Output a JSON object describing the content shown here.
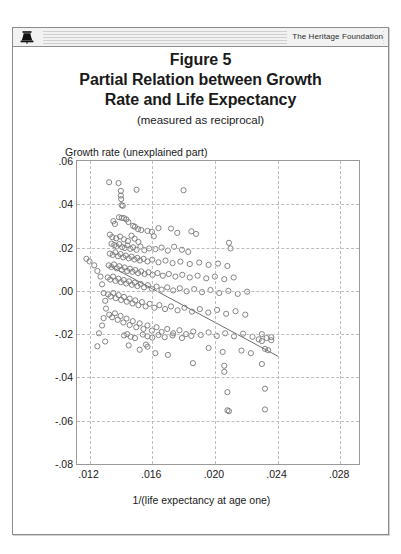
{
  "header": {
    "brand": "The Heritage Foundation",
    "logo_icon": "liberty-bell-icon"
  },
  "title": {
    "line1": "Figure 5",
    "line2": "Partial Relation between Growth",
    "line3": "Rate and Life Expectancy",
    "subtitle": "(measured as reciprocal)"
  },
  "chart_data": {
    "type": "scatter",
    "xlabel": "1/(life expectancy at age one)",
    "ylabel": "Growth rate (unexplained part)",
    "xlim": [
      0.0112,
      0.0292
    ],
    "ylim": [
      -0.08,
      0.06
    ],
    "xticks": [
      0.012,
      0.016,
      0.02,
      0.024,
      0.028
    ],
    "xtick_labels": [
      ".012",
      ".016",
      ".020",
      ".024",
      ".028"
    ],
    "yticks": [
      0.06,
      0.04,
      0.02,
      0.0,
      -0.02,
      -0.04,
      -0.06,
      -0.08
    ],
    "ytick_labels": [
      ".06",
      ".04",
      ".02",
      ".00",
      "-.02",
      "-.04",
      "-.06",
      "-.08"
    ],
    "grid": true,
    "grid_style": "dashed",
    "grid_color": "#bdbdbd",
    "legend": null,
    "marker": {
      "shape": "open-circle",
      "radius_px": 2.6,
      "stroke": "#777777",
      "fill": "none",
      "stroke_width": 0.9
    },
    "fit_line": {
      "label": "partial regression line",
      "color": "#6e6e6e",
      "width": 1,
      "x_start": 0.0133,
      "y_start": 0.0115,
      "x_end": 0.0241,
      "y_end": -0.0305
    },
    "points": [
      [
        0.01325,
        0.0502
      ],
      [
        0.01385,
        0.0498
      ],
      [
        0.014,
        0.0462
      ],
      [
        0.014,
        0.044
      ],
      [
        0.01402,
        0.0424
      ],
      [
        0.01405,
        0.0396
      ],
      [
        0.01412,
        0.0393
      ],
      [
        0.015,
        0.0467
      ],
      [
        0.018,
        0.0465
      ],
      [
        0.01388,
        0.034
      ],
      [
        0.01405,
        0.0337
      ],
      [
        0.0142,
        0.0336
      ],
      [
        0.01435,
        0.033
      ],
      [
        0.01352,
        0.0322
      ],
      [
        0.01362,
        0.0309
      ],
      [
        0.01448,
        0.0318
      ],
      [
        0.01478,
        0.03
      ],
      [
        0.0149,
        0.0296
      ],
      [
        0.0151,
        0.0285
      ],
      [
        0.0153,
        0.0281
      ],
      [
        0.0157,
        0.0277
      ],
      [
        0.01598,
        0.0273
      ],
      [
        0.0164,
        0.029
      ],
      [
        0.0172,
        0.0288
      ],
      [
        0.0176,
        0.0268
      ],
      [
        0.0185,
        0.0275
      ],
      [
        0.0188,
        0.0263
      ],
      [
        0.0161,
        0.0252
      ],
      [
        0.0133,
        0.026
      ],
      [
        0.01345,
        0.0248
      ],
      [
        0.0137,
        0.0243
      ],
      [
        0.01395,
        0.0251
      ],
      [
        0.0142,
        0.0238
      ],
      [
        0.01445,
        0.023
      ],
      [
        0.01468,
        0.0255
      ],
      [
        0.01488,
        0.0241
      ],
      [
        0.01512,
        0.0226
      ],
      [
        0.0134,
        0.0218
      ],
      [
        0.01358,
        0.0212
      ],
      [
        0.01372,
        0.0206
      ],
      [
        0.0139,
        0.0216
      ],
      [
        0.01408,
        0.0202
      ],
      [
        0.01425,
        0.0198
      ],
      [
        0.01442,
        0.021
      ],
      [
        0.0146,
        0.0194
      ],
      [
        0.01478,
        0.0201
      ],
      [
        0.015,
        0.019
      ],
      [
        0.01525,
        0.0205
      ],
      [
        0.0155,
        0.0188
      ],
      [
        0.0158,
        0.0196
      ],
      [
        0.0162,
        0.0193
      ],
      [
        0.0166,
        0.02
      ],
      [
        0.017,
        0.0186
      ],
      [
        0.0174,
        0.0204
      ],
      [
        0.0179,
        0.019
      ],
      [
        0.0183,
        0.018
      ],
      [
        0.0209,
        0.0222
      ],
      [
        0.021,
        0.0196
      ],
      [
        0.0133,
        0.0172
      ],
      [
        0.01348,
        0.0166
      ],
      [
        0.01365,
        0.0178
      ],
      [
        0.01382,
        0.016
      ],
      [
        0.01398,
        0.017
      ],
      [
        0.01415,
        0.0155
      ],
      [
        0.01432,
        0.0163
      ],
      [
        0.0145,
        0.015
      ],
      [
        0.01468,
        0.0158
      ],
      [
        0.01486,
        0.0145
      ],
      [
        0.01505,
        0.0152
      ],
      [
        0.01522,
        0.014
      ],
      [
        0.01545,
        0.0148
      ],
      [
        0.0157,
        0.0136
      ],
      [
        0.016,
        0.0144
      ],
      [
        0.0164,
        0.0132
      ],
      [
        0.01685,
        0.014
      ],
      [
        0.0173,
        0.0128
      ],
      [
        0.0178,
        0.0135
      ],
      [
        0.0184,
        0.0124
      ],
      [
        0.019,
        0.0131
      ],
      [
        0.0196,
        0.012
      ],
      [
        0.0202,
        0.0126
      ],
      [
        0.0208,
        0.0115
      ],
      [
        0.01322,
        0.0118
      ],
      [
        0.0134,
        0.011
      ],
      [
        0.01356,
        0.0122
      ],
      [
        0.01374,
        0.0104
      ],
      [
        0.0139,
        0.0114
      ],
      [
        0.01406,
        0.0098
      ],
      [
        0.01424,
        0.0108
      ],
      [
        0.0144,
        0.0092
      ],
      [
        0.01458,
        0.0102
      ],
      [
        0.01474,
        0.0088
      ],
      [
        0.01492,
        0.0096
      ],
      [
        0.0151,
        0.0082
      ],
      [
        0.0153,
        0.009
      ],
      [
        0.01552,
        0.0078
      ],
      [
        0.01576,
        0.0086
      ],
      [
        0.01602,
        0.0074
      ],
      [
        0.01634,
        0.0082
      ],
      [
        0.01668,
        0.007
      ],
      [
        0.01706,
        0.0078
      ],
      [
        0.01748,
        0.0066
      ],
      [
        0.01792,
        0.0074
      ],
      [
        0.0184,
        0.0062
      ],
      [
        0.0189,
        0.007
      ],
      [
        0.01945,
        0.0058
      ],
      [
        0.02,
        0.0066
      ],
      [
        0.0206,
        0.0054
      ],
      [
        0.0212,
        0.0062
      ],
      [
        0.01316,
        0.0062
      ],
      [
        0.01332,
        0.0052
      ],
      [
        0.0135,
        0.0066
      ],
      [
        0.01366,
        0.0046
      ],
      [
        0.01384,
        0.0056
      ],
      [
        0.014,
        0.004
      ],
      [
        0.01418,
        0.005
      ],
      [
        0.01434,
        0.0034
      ],
      [
        0.01452,
        0.0044
      ],
      [
        0.0147,
        0.0028
      ],
      [
        0.01488,
        0.0038
      ],
      [
        0.01506,
        0.0022
      ],
      [
        0.01526,
        0.0032
      ],
      [
        0.01548,
        0.0016
      ],
      [
        0.01572,
        0.0026
      ],
      [
        0.01598,
        0.001
      ],
      [
        0.01628,
        0.002
      ],
      [
        0.0166,
        0.0006
      ],
      [
        0.01696,
        0.0016
      ],
      [
        0.01734,
        0.0002
      ],
      [
        0.01776,
        0.0012
      ],
      [
        0.0182,
        -0.0002
      ],
      [
        0.01868,
        0.0008
      ],
      [
        0.01918,
        -0.0006
      ],
      [
        0.01972,
        0.0004
      ],
      [
        0.02028,
        -0.001
      ],
      [
        0.02086,
        0.0
      ],
      [
        0.02146,
        -0.0014
      ],
      [
        0.02206,
        -0.0004
      ],
      [
        0.01318,
        -0.0016
      ],
      [
        0.01334,
        -0.0026
      ],
      [
        0.01352,
        -0.001
      ],
      [
        0.01368,
        -0.0034
      ],
      [
        0.01386,
        -0.002
      ],
      [
        0.01402,
        -0.0042
      ],
      [
        0.0142,
        -0.0028
      ],
      [
        0.01438,
        -0.005
      ],
      [
        0.01456,
        -0.0036
      ],
      [
        0.01474,
        -0.0058
      ],
      [
        0.01492,
        -0.0044
      ],
      [
        0.01512,
        -0.0066
      ],
      [
        0.01534,
        -0.0052
      ],
      [
        0.01558,
        -0.0072
      ],
      [
        0.01584,
        -0.006
      ],
      [
        0.01614,
        -0.0078
      ],
      [
        0.01646,
        -0.0066
      ],
      [
        0.01682,
        -0.0084
      ],
      [
        0.0172,
        -0.0072
      ],
      [
        0.01762,
        -0.009
      ],
      [
        0.01806,
        -0.0078
      ],
      [
        0.01854,
        -0.0096
      ],
      [
        0.01904,
        -0.0084
      ],
      [
        0.01958,
        -0.01
      ],
      [
        0.02014,
        -0.0088
      ],
      [
        0.02072,
        -0.0106
      ],
      [
        0.02132,
        -0.0094
      ],
      [
        0.02194,
        -0.011
      ],
      [
        0.01326,
        -0.011
      ],
      [
        0.01344,
        -0.0122
      ],
      [
        0.01362,
        -0.0104
      ],
      [
        0.0138,
        -0.0134
      ],
      [
        0.01398,
        -0.0116
      ],
      [
        0.01416,
        -0.0146
      ],
      [
        0.01436,
        -0.0128
      ],
      [
        0.01456,
        -0.0158
      ],
      [
        0.01476,
        -0.014
      ],
      [
        0.01498,
        -0.0168
      ],
      [
        0.0152,
        -0.015
      ],
      [
        0.01544,
        -0.0176
      ],
      [
        0.0157,
        -0.016
      ],
      [
        0.01598,
        -0.0184
      ],
      [
        0.01628,
        -0.0168
      ],
      [
        0.0166,
        -0.019
      ],
      [
        0.01696,
        -0.0176
      ],
      [
        0.01734,
        -0.0196
      ],
      [
        0.01774,
        -0.0182
      ],
      [
        0.01816,
        -0.02
      ],
      [
        0.01862,
        -0.0188
      ],
      [
        0.0191,
        -0.0204
      ],
      [
        0.0196,
        -0.0192
      ],
      [
        0.02012,
        -0.0208
      ],
      [
        0.02066,
        -0.0196
      ],
      [
        0.02122,
        -0.021
      ],
      [
        0.0218,
        -0.0198
      ],
      [
        0.0224,
        -0.0212
      ],
      [
        0.023,
        -0.02
      ],
      [
        0.0236,
        -0.0214
      ],
      [
        0.0142,
        -0.0206
      ],
      [
        0.0144,
        -0.02
      ],
      [
        0.01462,
        -0.0212
      ],
      [
        0.0149,
        -0.0218
      ],
      [
        0.0154,
        -0.0202
      ],
      [
        0.0157,
        -0.021
      ],
      [
        0.016,
        -0.0216
      ],
      [
        0.0164,
        -0.0204
      ],
      [
        0.0168,
        -0.0214
      ],
      [
        0.0173,
        -0.0206
      ],
      [
        0.0179,
        -0.0218
      ],
      [
        0.0185,
        -0.0208
      ],
      [
        0.0228,
        -0.0224
      ],
      [
        0.023,
        -0.0232
      ],
      [
        0.0233,
        -0.0218
      ],
      [
        0.0236,
        -0.0228
      ],
      [
        0.0145,
        -0.0252
      ],
      [
        0.0156,
        -0.0248
      ],
      [
        0.0157,
        -0.0258
      ],
      [
        0.0196,
        -0.0264
      ],
      [
        0.0205,
        -0.0282
      ],
      [
        0.0217,
        -0.0276
      ],
      [
        0.0223,
        -0.0288
      ],
      [
        0.0232,
        -0.0268
      ],
      [
        0.0234,
        -0.0274
      ],
      [
        0.0152,
        -0.0272
      ],
      [
        0.0162,
        -0.0288
      ],
      [
        0.017,
        -0.0296
      ],
      [
        0.0206,
        -0.0346
      ],
      [
        0.0206,
        -0.0374
      ],
      [
        0.023,
        -0.0338
      ],
      [
        0.0186,
        -0.0334
      ],
      [
        0.0208,
        -0.0468
      ],
      [
        0.0232,
        -0.0452
      ],
      [
        0.0208,
        -0.0552
      ],
      [
        0.0209,
        -0.0556
      ],
      [
        0.0232,
        -0.0548
      ],
      [
        0.0118,
        0.0148
      ],
      [
        0.012,
        0.0136
      ],
      [
        0.0123,
        0.0118
      ],
      [
        0.0125,
        0.0092
      ],
      [
        0.0127,
        0.0066
      ],
      [
        0.0128,
        0.003
      ],
      [
        0.0129,
        -0.001
      ],
      [
        0.013,
        -0.0046
      ],
      [
        0.01305,
        -0.0082
      ],
      [
        0.0129,
        -0.0126
      ],
      [
        0.0128,
        -0.016
      ],
      [
        0.0126,
        -0.0196
      ],
      [
        0.013,
        -0.0234
      ],
      [
        0.0125,
        -0.0256
      ]
    ]
  }
}
